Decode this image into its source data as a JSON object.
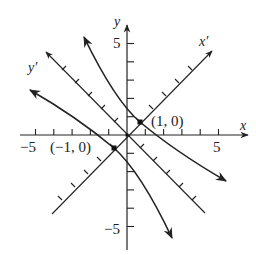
{
  "diagram": {
    "axes": {
      "x_label": "x",
      "y_label": "y",
      "x_prime_label": "x′",
      "y_prime_label": "y′",
      "x_tick_label_pos": "5",
      "x_tick_label_neg": "−5",
      "y_tick_label_pos": "5",
      "y_tick_label_neg": "−5"
    },
    "points": [
      {
        "label": "(1, 0)",
        "x": 1,
        "y": 0
      },
      {
        "label": "(−1, 0)",
        "x": -1,
        "y": 0
      }
    ],
    "curves": [
      {
        "name": "hyperbola-branch-upper-right"
      },
      {
        "name": "hyperbola-branch-lower-left"
      }
    ],
    "colors": {
      "ink": "#222222",
      "background": "#ffffff"
    }
  }
}
